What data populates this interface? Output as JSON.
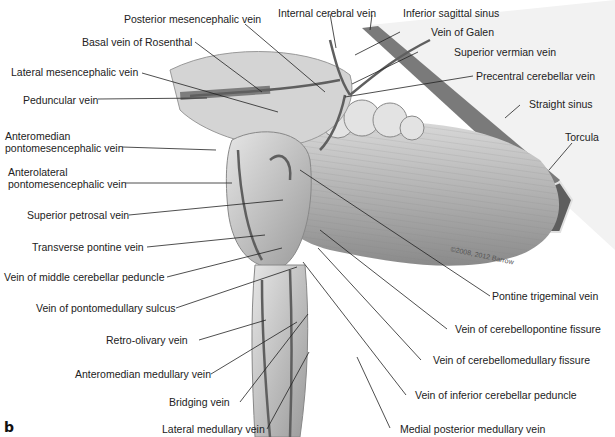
{
  "figure": {
    "panel_letter": "b",
    "watermark": "©2008, 2012 Barrow",
    "colors": {
      "background": "#ffffff",
      "tissue": "#c9c9c9",
      "tissue_dark": "#8e8e8e",
      "vein": "#5f5f5f",
      "sinus": "#6c6c6c",
      "leader_line": "#222222",
      "label_text": "#222222"
    },
    "labels_left": [
      {
        "text": "Basal vein of Rosenthal"
      },
      {
        "text": "Lateral mesencephalic vein"
      },
      {
        "text": "Peduncular vein"
      },
      {
        "text": "Anteromedian"
      },
      {
        "text": "pontomesencephalic vein"
      },
      {
        "text": "Anterolateral"
      },
      {
        "text": "pontomesencephalic vein"
      },
      {
        "text": "Superior petrosal vein"
      },
      {
        "text": "Transverse pontine vein"
      },
      {
        "text": "Vein of middle cerebellar peduncle"
      },
      {
        "text": "Vein of pontomedullary sulcus"
      },
      {
        "text": "Retro-olivary vein"
      },
      {
        "text": "Anteromedian medullary vein"
      },
      {
        "text": "Bridging vein"
      },
      {
        "text": "Lateral medullary vein"
      }
    ],
    "labels_top": [
      {
        "text": "Posterior mesencephalic vein"
      },
      {
        "text": "Internal cerebral vein"
      },
      {
        "text": "Inferior sagittal sinus"
      }
    ],
    "labels_right": [
      {
        "text": "Vein of Galen"
      },
      {
        "text": "Superior vermian vein"
      },
      {
        "text": "Precentral cerebellar vein"
      },
      {
        "text": "Straight sinus"
      },
      {
        "text": "Torcula"
      },
      {
        "text": "Pontine trigeminal vein"
      },
      {
        "text": "Vein of cerebellopontine fissure"
      },
      {
        "text": "Vein of cerebellomedullary fissure"
      },
      {
        "text": "Vein of inferior cerebellar peduncle"
      },
      {
        "text": "Medial posterior medullary vein"
      }
    ]
  }
}
